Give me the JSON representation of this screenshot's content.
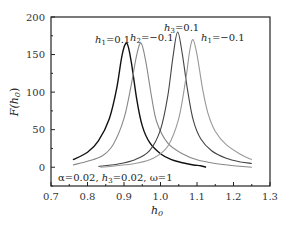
{
  "chart_data": {
    "type": "line",
    "title": "",
    "xlabel": "h0",
    "ylabel": "F(h0)",
    "xlim": [
      0.7,
      1.3
    ],
    "ylim": [
      -25,
      200
    ],
    "x_ticks": [
      "0.7",
      "0.8",
      "0.9",
      "1.0",
      "1.1",
      "1.2",
      "1.3"
    ],
    "y_ticks": [
      "0",
      "50",
      "100",
      "150",
      "200"
    ],
    "grid": false,
    "annotation": "α=0.02, h3=0.02, ω=1",
    "series": [
      {
        "name": "h1=0.1",
        "color": "#111111",
        "points": [
          [
            0.76,
            10
          ],
          [
            0.8,
            20
          ],
          [
            0.83,
            35
          ],
          [
            0.86,
            65
          ],
          [
            0.88,
            105
          ],
          [
            0.895,
            150
          ],
          [
            0.908,
            165
          ],
          [
            0.92,
            140
          ],
          [
            0.935,
            90
          ],
          [
            0.95,
            55
          ],
          [
            0.97,
            33
          ],
          [
            1.0,
            18
          ],
          [
            1.03,
            10
          ],
          [
            1.06,
            6
          ],
          [
            1.09,
            3
          ],
          [
            1.11,
            2
          ],
          [
            1.125,
            0
          ]
        ]
      },
      {
        "name": "h2=-0.1",
        "color": "#888888",
        "points": [
          [
            0.76,
            3
          ],
          [
            0.8,
            8
          ],
          [
            0.84,
            15
          ],
          [
            0.87,
            30
          ],
          [
            0.9,
            65
          ],
          [
            0.92,
            110
          ],
          [
            0.935,
            150
          ],
          [
            0.947,
            165
          ],
          [
            0.96,
            140
          ],
          [
            0.975,
            95
          ],
          [
            0.99,
            60
          ],
          [
            1.02,
            32
          ],
          [
            1.06,
            18
          ],
          [
            1.1,
            10
          ],
          [
            1.15,
            5
          ],
          [
            1.2,
            2
          ],
          [
            1.25,
            0
          ]
        ]
      },
      {
        "name": "h3=0.1",
        "color": "#444444",
        "points": [
          [
            0.83,
            1
          ],
          [
            0.88,
            4
          ],
          [
            0.93,
            10
          ],
          [
            0.97,
            22
          ],
          [
            1.0,
            50
          ],
          [
            1.02,
            95
          ],
          [
            1.035,
            150
          ],
          [
            1.047,
            180
          ],
          [
            1.06,
            150
          ],
          [
            1.075,
            100
          ],
          [
            1.09,
            62
          ],
          [
            1.11,
            38
          ],
          [
            1.14,
            22
          ],
          [
            1.18,
            12
          ],
          [
            1.22,
            7
          ],
          [
            1.25,
            5
          ]
        ]
      },
      {
        "name": "h1=-0.1",
        "color": "#999999",
        "points": [
          [
            0.835,
            0
          ],
          [
            0.88,
            2
          ],
          [
            0.93,
            5
          ],
          [
            0.98,
            12
          ],
          [
            1.02,
            28
          ],
          [
            1.05,
            65
          ],
          [
            1.07,
            120
          ],
          [
            1.08,
            155
          ],
          [
            1.089,
            170
          ],
          [
            1.1,
            150
          ],
          [
            1.115,
            105
          ],
          [
            1.13,
            72
          ],
          [
            1.15,
            48
          ],
          [
            1.18,
            30
          ],
          [
            1.22,
            17
          ],
          [
            1.25,
            10
          ]
        ]
      }
    ],
    "peak_labels": [
      {
        "text_main": "h",
        "sub": "1",
        "text_rest": "=0.1",
        "x": 1.0,
        "y": 1.0
      },
      {
        "text_main": "h",
        "sub": "2",
        "text_rest": "=−0.1"
      },
      {
        "text_main": "h",
        "sub": "3",
        "text_rest": "=0.1"
      },
      {
        "text_main": "h",
        "sub": "1",
        "text_rest": "=−0.1"
      }
    ]
  },
  "labels": {
    "ylabel_main": "F(h",
    "ylabel_sub": "0",
    "ylabel_end": ")",
    "xlabel_main": "h",
    "xlabel_sub": "0",
    "ann_alpha": "α=0.02, ",
    "ann_h": "h",
    "ann_h_sub": "3",
    "ann_h_rest": "=0.02, ω=1",
    "peak1_main": "h",
    "peak1_sub": "1",
    "peak1_rest": "=0.1",
    "peak2_main": "h",
    "peak2_sub": "2",
    "peak2_rest": "=−0.1",
    "peak3_main": "h",
    "peak3_sub": "3",
    "peak3_rest": "=0.1",
    "peak4_main": "h",
    "peak4_sub": "1",
    "peak4_rest": "=−0.1"
  }
}
